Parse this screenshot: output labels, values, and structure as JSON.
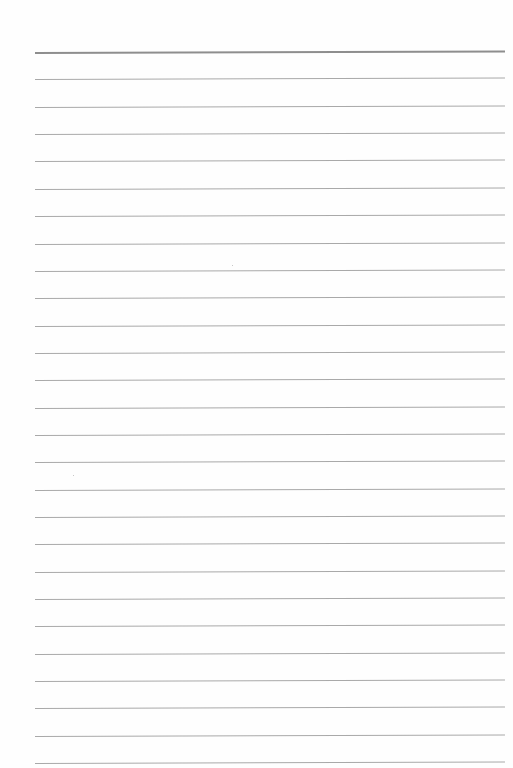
{
  "document": {
    "type": "lined-paper",
    "background_color": "#fefefe",
    "rule_color": "#a9a9a9",
    "top_rule_color": "#8e8e8e",
    "margin_left_px": 35,
    "margin_right_px": 505,
    "first_rule_y": 52,
    "rule_spacing_px": 27.35,
    "rule_count": 27,
    "text": ""
  }
}
